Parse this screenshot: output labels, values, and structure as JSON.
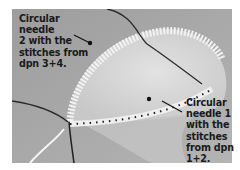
{
  "image": {
    "subject": "knitting-in-the-round-photo",
    "background_color": "#a9a9a9"
  },
  "annotations": [
    {
      "id": "needle-2",
      "text": "Circular needle\n2 with the\nstitches from\ndpn 3+4."
    },
    {
      "id": "needle-1",
      "text": "Circular\nneedle 1\nwith the\nstitches\nfrom dpn\n1+2."
    }
  ]
}
